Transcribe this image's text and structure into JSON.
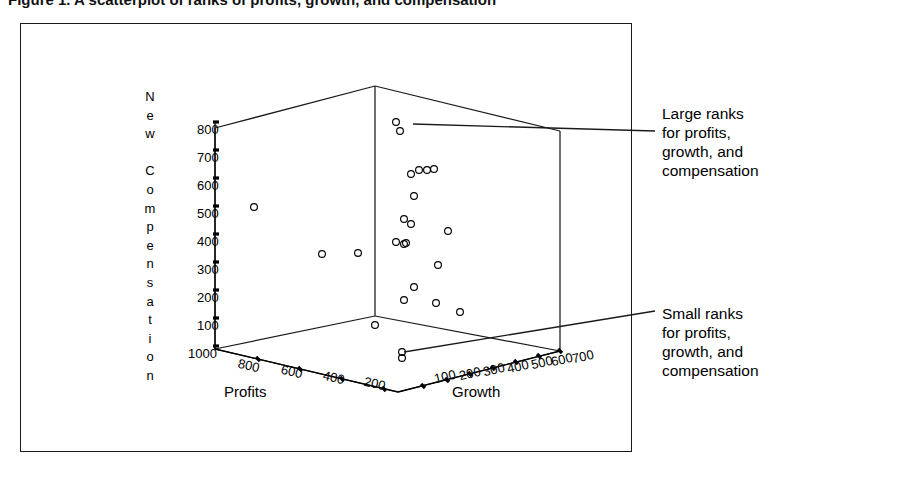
{
  "figure": {
    "title": "Figure 1.  A scatterplot of ranks of profits, growth, and compensation",
    "border_color": "#1a1a1a",
    "background": "#ffffff"
  },
  "annotations": [
    {
      "name": "large-ranks",
      "text": "Large ranks\nfor profits,\ngrowth, and\ncompensation",
      "leader_from": [
        822,
        131
      ],
      "leader_to": [
        413,
        124
      ]
    },
    {
      "name": "small-ranks",
      "text": "Small ranks\nfor profits,\ngrowth, and\ncompensation",
      "leader_from": [
        822,
        311
      ],
      "leader_to": [
        404,
        352
      ]
    }
  ],
  "chart_data": {
    "type": "scatter",
    "title": "A scatterplot of ranks of profits, growth, and compensation",
    "projection": "3d",
    "xlabel": "Profits",
    "ylabel": "Growth",
    "zlabel": "New Compensation",
    "zlabel_letters": [
      "N",
      "e",
      "w",
      "",
      "C",
      "o",
      "m",
      "p",
      "e",
      "n",
      "s",
      "a",
      "t",
      "i",
      "o",
      "n"
    ],
    "grid": false,
    "legend": "none",
    "axes": {
      "profits": {
        "label": "Profits",
        "ticks": [
          1000,
          800,
          600,
          400,
          200
        ],
        "direction": "descending",
        "range": [
          1000,
          100
        ]
      },
      "growth": {
        "label": "Growth",
        "ticks": [
          100,
          200,
          300,
          400,
          500,
          600,
          700
        ],
        "direction": "ascending",
        "range": [
          0,
          700
        ]
      },
      "compensation": {
        "label": "New Compensation",
        "ticks": [
          1000,
          100,
          200,
          300,
          400,
          500,
          600,
          700,
          800
        ],
        "direction": "ascending",
        "range": [
          1000,
          800
        ]
      }
    },
    "marker": {
      "shape": "open-circle",
      "radius": 3.4,
      "color": "#000000",
      "fill": "none"
    },
    "points": [
      {
        "px": 254,
        "py": 207
      },
      {
        "px": 322,
        "py": 254
      },
      {
        "px": 358,
        "py": 253
      },
      {
        "px": 396,
        "py": 122
      },
      {
        "px": 400,
        "py": 131
      },
      {
        "px": 411,
        "py": 174
      },
      {
        "px": 419,
        "py": 170
      },
      {
        "px": 427,
        "py": 170
      },
      {
        "px": 434,
        "py": 169
      },
      {
        "px": 414,
        "py": 196
      },
      {
        "px": 404,
        "py": 219
      },
      {
        "px": 411,
        "py": 224
      },
      {
        "px": 448,
        "py": 231
      },
      {
        "px": 406,
        "py": 243
      },
      {
        "px": 404,
        "py": 244
      },
      {
        "px": 396,
        "py": 242
      },
      {
        "px": 438,
        "py": 265
      },
      {
        "px": 404,
        "py": 300
      },
      {
        "px": 414,
        "py": 287
      },
      {
        "px": 436,
        "py": 303
      },
      {
        "px": 460,
        "py": 312
      },
      {
        "px": 375,
        "py": 325
      },
      {
        "px": 402,
        "py": 352
      },
      {
        "px": 402,
        "py": 358
      }
    ]
  },
  "ticks": {
    "compensation": [
      {
        "value": "800",
        "x": 197,
        "y": 122
      },
      {
        "value": "700",
        "x": 197,
        "y": 150
      },
      {
        "value": "600",
        "x": 197,
        "y": 178
      },
      {
        "value": "500",
        "x": 197,
        "y": 206
      },
      {
        "value": "400",
        "x": 197,
        "y": 234
      },
      {
        "value": "300",
        "x": 197,
        "y": 262
      },
      {
        "value": "200",
        "x": 197,
        "y": 290
      },
      {
        "value": "100",
        "x": 197,
        "y": 318
      },
      {
        "value": "1000",
        "x": 188,
        "y": 346
      }
    ],
    "profits": [
      {
        "value": "800",
        "x": 238,
        "y": 358
      },
      {
        "value": "600",
        "x": 281,
        "y": 364
      },
      {
        "value": "400",
        "x": 323,
        "y": 370
      },
      {
        "value": "200",
        "x": 364,
        "y": 376
      }
    ],
    "growth": [
      {
        "value": "100",
        "x": 434,
        "y": 369
      },
      {
        "value": "200",
        "x": 459,
        "y": 366
      },
      {
        "value": "300",
        "x": 483,
        "y": 362
      },
      {
        "value": "400",
        "x": 507,
        "y": 359
      },
      {
        "value": "500",
        "x": 531,
        "y": 355
      },
      {
        "value": "600",
        "x": 551,
        "y": 352
      },
      {
        "value": "700",
        "x": 572,
        "y": 349
      }
    ]
  }
}
